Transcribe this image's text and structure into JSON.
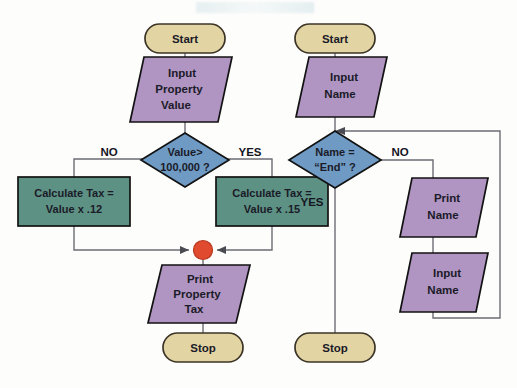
{
  "figure": {
    "background_color": "#fdfdfc"
  },
  "palette": {
    "terminator_fill": "#e3d4a4",
    "terminator_stroke": "#3b3426",
    "io_fill": "#b094c2",
    "io_stroke": "#121212",
    "process_fill": "#5d9184",
    "process_stroke": "#121212",
    "decision_fill": "#6e9ac4",
    "decision_stroke": "#121212",
    "connector_dot_fill": "#e04a2f",
    "connector_dot_stroke": "#b8381f",
    "line_color": "#6b6b74",
    "text_color": "#1b1b28"
  },
  "left_flowchart": {
    "name": "property-tax-flowchart",
    "nodes": {
      "start": {
        "type": "terminator",
        "label": "Start"
      },
      "input_property_value": {
        "type": "io",
        "lines": [
          "Input",
          "Property",
          "Value"
        ]
      },
      "decision_value": {
        "type": "decision",
        "lines": [
          "Value>",
          "100,000 ?"
        ]
      },
      "calculate_tax_12": {
        "type": "process",
        "lines": [
          "Calculate Tax =",
          "Value x .12"
        ]
      },
      "calculate_tax_15": {
        "type": "process",
        "lines": [
          "Calculate Tax =",
          "Value x .15"
        ]
      },
      "merge_point": {
        "type": "connector",
        "label": ""
      },
      "print_property_tax": {
        "type": "io",
        "lines": [
          "Print",
          "Property",
          "Tax"
        ]
      },
      "stop": {
        "type": "terminator",
        "label": "Stop"
      }
    },
    "branches": {
      "no": "NO",
      "yes": "YES"
    }
  },
  "right_flowchart": {
    "name": "print-name-loop-flowchart",
    "nodes": {
      "start": {
        "type": "terminator",
        "label": "Start"
      },
      "input_name_top": {
        "type": "io",
        "lines": [
          "Input",
          "Name"
        ]
      },
      "decision_name": {
        "type": "decision",
        "lines": [
          "Name =",
          "“End” ?"
        ]
      },
      "print_name": {
        "type": "io",
        "lines": [
          "Print",
          "Name"
        ]
      },
      "input_name_loop": {
        "type": "io",
        "lines": [
          "Input",
          "Name"
        ]
      },
      "stop": {
        "type": "terminator",
        "label": "Stop"
      }
    },
    "branches": {
      "no": "NO",
      "yes": "YES"
    }
  }
}
